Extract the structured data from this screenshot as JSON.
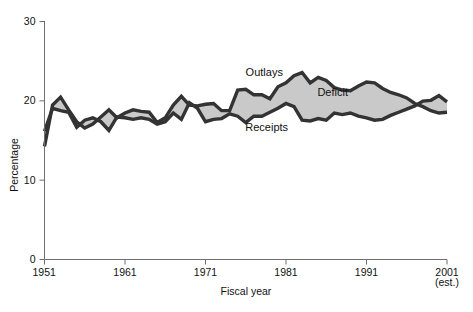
{
  "chart_data": {
    "type": "line",
    "title": "",
    "xlabel": "Fiscal year",
    "ylabel": "Percentage",
    "xlim": [
      1951,
      2001
    ],
    "ylim": [
      0,
      30
    ],
    "yticks": [
      0,
      10,
      20,
      30
    ],
    "ytick_labels": [
      "0",
      "10",
      "20",
      "30"
    ],
    "xticks": [
      1951,
      1961,
      1971,
      1981,
      1991,
      2001
    ],
    "xtick_labels": [
      "1951",
      "1961",
      "1971",
      "1981",
      "1991",
      "2001"
    ],
    "xtick_sublabel": "(est.)",
    "grid": false,
    "legend": "inline-annotations",
    "annotations": [
      {
        "text": "Outlays",
        "year": 1978.3,
        "value": 23.1
      },
      {
        "text": "Deficit",
        "year": 1986.8,
        "value": 20.6
      },
      {
        "text": "Receipts",
        "year": 1978.6,
        "value": 16.1
      }
    ],
    "fill_label": "Deficit",
    "x": [
      1951,
      1952,
      1953,
      1954,
      1955,
      1956,
      1957,
      1958,
      1959,
      1960,
      1961,
      1962,
      1963,
      1964,
      1965,
      1966,
      1967,
      1968,
      1969,
      1970,
      1971,
      1972,
      1973,
      1974,
      1975,
      1976,
      1977,
      1978,
      1979,
      1980,
      1981,
      1982,
      1983,
      1984,
      1985,
      1986,
      1987,
      1988,
      1989,
      1990,
      1991,
      1992,
      1993,
      1994,
      1995,
      1996,
      1997,
      1998,
      1999,
      2000,
      2001
    ],
    "series": [
      {
        "name": "Outlays",
        "color": "#333333",
        "values": [
          14.2,
          19.4,
          20.4,
          18.8,
          17.3,
          16.5,
          17.0,
          17.9,
          18.8,
          17.8,
          18.4,
          18.8,
          18.6,
          18.5,
          17.2,
          17.8,
          19.4,
          20.5,
          19.4,
          19.3,
          19.5,
          19.6,
          18.7,
          18.7,
          21.3,
          21.4,
          20.7,
          20.7,
          20.2,
          21.7,
          22.2,
          23.1,
          23.5,
          22.2,
          22.9,
          22.5,
          21.6,
          21.3,
          21.2,
          21.8,
          22.3,
          22.2,
          21.5,
          21.0,
          20.7,
          20.3,
          19.6,
          19.2,
          18.7,
          18.4,
          18.5
        ]
      },
      {
        "name": "Receipts",
        "color": "#333333",
        "values": [
          16.1,
          19.0,
          18.7,
          18.5,
          16.6,
          17.5,
          17.8,
          17.3,
          16.2,
          17.9,
          17.8,
          17.6,
          17.8,
          17.6,
          17.0,
          17.3,
          18.4,
          17.6,
          19.7,
          19.0,
          17.3,
          17.6,
          17.7,
          18.3,
          18.0,
          17.2,
          18.0,
          18.0,
          18.5,
          19.0,
          19.6,
          19.2,
          17.5,
          17.4,
          17.7,
          17.5,
          18.4,
          18.2,
          18.4,
          18.0,
          17.8,
          17.5,
          17.6,
          18.1,
          18.5,
          18.9,
          19.3,
          19.9,
          20.0,
          20.6,
          19.8
        ]
      }
    ],
    "fill_color": "#c9c9c9",
    "line_color": "#333333",
    "axis_color": "#6e6e6e"
  }
}
